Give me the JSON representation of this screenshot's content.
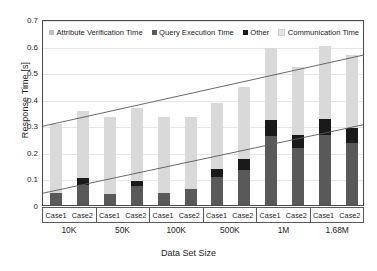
{
  "chart_data": {
    "type": "bar",
    "title": "",
    "xlabel": "Data Set Size",
    "ylabel": "Response Time [s]",
    "ylim": [
      0,
      0.7
    ],
    "yticks": [
      0,
      0.1,
      0.2,
      0.3,
      0.4,
      0.5,
      0.6,
      0.7
    ],
    "ytick_labels": [
      "0",
      "0.1",
      "0.2",
      "0.3",
      "0.4",
      "0.5",
      "0.6",
      "0.7"
    ],
    "grid": true,
    "stacked": true,
    "legend_position": "top-inside",
    "groups": [
      "10K",
      "50K",
      "100K",
      "500K",
      "1M",
      "1.68M"
    ],
    "subcategories": [
      "Case1",
      "Case2"
    ],
    "categories": [
      "10K Case1",
      "10K Case2",
      "50K Case1",
      "50K Case2",
      "100K Case1",
      "100K Case2",
      "500K Case1",
      "500K Case2",
      "1M Case1",
      "1M Case2",
      "1.68M Case1",
      "1.68M Case2"
    ],
    "series": [
      {
        "name": "Query Execution Time",
        "color": "#595959",
        "values": [
          0.045,
          0.075,
          0.04,
          0.07,
          0.045,
          0.06,
          0.105,
          0.13,
          0.26,
          0.215,
          0.265,
          0.235
        ]
      },
      {
        "name": "Other",
        "color": "#1a1a1a",
        "values": [
          0.0,
          0.025,
          0.0,
          0.02,
          0.0,
          0.0,
          0.03,
          0.045,
          0.06,
          0.05,
          0.06,
          0.055
        ]
      },
      {
        "name": "Attribute Verification Time",
        "color": "#bfbfbf",
        "values": [
          0.0,
          0.0,
          0.0,
          0.0,
          0.0,
          0.0,
          0.0,
          0.0,
          0.0,
          0.0,
          0.0,
          0.0
        ]
      },
      {
        "name": "Communication Time",
        "color": "#d9d9d9",
        "values": [
          0.26,
          0.255,
          0.29,
          0.275,
          0.285,
          0.27,
          0.25,
          0.27,
          0.27,
          0.255,
          0.275,
          0.275
        ]
      }
    ],
    "totals": [
      0.305,
      0.355,
      0.33,
      0.365,
      0.33,
      0.33,
      0.385,
      0.445,
      0.59,
      0.52,
      0.6,
      0.565
    ],
    "trendlines": [
      {
        "name": "total-trend",
        "x0": 0,
        "y0": 0.3,
        "x1": 12,
        "y1": 0.57,
        "color": "#595959"
      },
      {
        "name": "lower-trend",
        "x0": 0,
        "y0": 0.045,
        "x1": 12,
        "y1": 0.305,
        "color": "#595959"
      }
    ]
  },
  "legend": {
    "items": [
      {
        "label": "Attribute Verification Time",
        "color": "#bfbfbf"
      },
      {
        "label": "Query Execution Time",
        "color": "#595959"
      },
      {
        "label": "Other",
        "color": "#1a1a1a"
      },
      {
        "label": "Communication Time",
        "color": "#e3e3e3"
      }
    ]
  },
  "axes": {
    "y_title": "Response Time [s]",
    "x_title": "Data Set Size",
    "y_ticks": [
      "0.7",
      "0.6",
      "0.5",
      "0.4",
      "0.3",
      "0.2",
      "0.1",
      "0"
    ],
    "x_groups": [
      {
        "size": "10K",
        "cases": [
          "Case1",
          "Case2"
        ]
      },
      {
        "size": "50K",
        "cases": [
          "Case1",
          "Case2"
        ]
      },
      {
        "size": "100K",
        "cases": [
          "Case1",
          "Case2"
        ]
      },
      {
        "size": "500K",
        "cases": [
          "Case1",
          "Case2"
        ]
      },
      {
        "size": "1M",
        "cases": [
          "Case1",
          "Case2"
        ]
      },
      {
        "size": "1.68M",
        "cases": [
          "Case1",
          "Case2"
        ]
      }
    ]
  }
}
